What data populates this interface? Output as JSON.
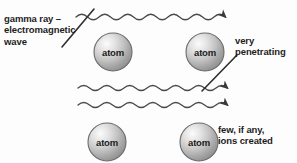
{
  "diagram": {
    "background_color": "#fdfdfd",
    "ink_color": "#404040",
    "text_color": "#1d1d1d"
  },
  "labels": {
    "gamma": "gamma ray –\nelectromagnetic\nwave",
    "penetrating": "very\npenetrating",
    "ions": "few, if any,\nions created"
  },
  "atoms": [
    {
      "label": "atom",
      "cx": 113,
      "cy": 52,
      "r": 19
    },
    {
      "label": "atom",
      "cx": 205,
      "cy": 52,
      "r": 19
    },
    {
      "label": "atom",
      "cx": 107,
      "cy": 142,
      "r": 19
    },
    {
      "label": "atom",
      "cx": 199,
      "cy": 142,
      "r": 19
    }
  ],
  "waves": [
    {
      "name": "top-wave",
      "y": 17,
      "x_start": 76,
      "x_end": 228,
      "amplitude": 5.5,
      "wavelength": 23
    },
    {
      "name": "middle-wave",
      "y": 88,
      "x_start": 78,
      "x_end": 228,
      "amplitude": 5,
      "wavelength": 23
    },
    {
      "name": "bottom-wave",
      "y": 105,
      "x_start": 78,
      "x_end": 228,
      "amplitude": 5,
      "wavelength": 23
    }
  ],
  "pointers": [
    {
      "name": "gamma-pointer",
      "x1": 62,
      "y1": 46,
      "x2": 93,
      "y2": 10
    },
    {
      "name": "penetrating-pointer",
      "x1": 203,
      "y1": 90,
      "x2": 236,
      "y2": 56
    }
  ],
  "arrowheads": [
    {
      "name": "top-arrow",
      "x": 228,
      "y": 17
    },
    {
      "name": "middle-arrow",
      "x": 228,
      "y": 88
    },
    {
      "name": "bottom-arrow",
      "x": 228,
      "y": 105
    }
  ]
}
